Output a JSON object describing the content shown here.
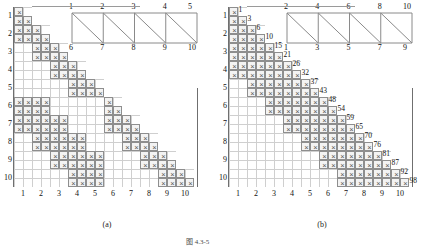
{
  "figure": {
    "caption": "图 4.3-5",
    "subcaptions": [
      "(a)",
      "(b)"
    ]
  },
  "panels": [
    {
      "id": "a",
      "label": "(a)",
      "truss": {
        "name": "truss-diagram-a",
        "top_nodes": [
          "1",
          "2",
          "3",
          "4",
          "5"
        ],
        "bottom_nodes": [
          "6",
          "7",
          "8",
          "9",
          "10"
        ],
        "panels": 4,
        "diagonal_direction": "top-left-to-bottom-right"
      },
      "matrix": {
        "name": "stiffness-matrix-a",
        "type": "banded-lower-triangular",
        "nodes": 10,
        "dof_per_node": 2,
        "row_labels": [
          "1",
          "2",
          "3",
          "4",
          "5",
          "6",
          "7",
          "8",
          "9",
          "10"
        ],
        "col_labels": [
          "1",
          "2",
          "3",
          "4",
          "5",
          "6",
          "7",
          "8",
          "9",
          "10"
        ],
        "connectivity": [
          [
            1
          ],
          [
            1,
            2
          ],
          [
            2,
            3
          ],
          [
            3,
            4
          ],
          [
            4,
            5
          ],
          [
            1,
            2,
            6
          ],
          [
            1,
            2,
            3,
            6,
            7
          ],
          [
            2,
            3,
            4,
            7,
            8
          ],
          [
            3,
            4,
            5,
            8,
            9
          ],
          [
            4,
            5,
            9,
            10
          ]
        ]
      }
    },
    {
      "id": "b",
      "label": "(b)",
      "truss": {
        "name": "truss-diagram-b",
        "top_nodes": [
          "2",
          "4",
          "6",
          "8",
          "10"
        ],
        "bottom_nodes": [
          "1",
          "3",
          "5",
          "7",
          "9"
        ],
        "panels": 4,
        "diagonal_direction": "top-left-to-bottom-right"
      },
      "matrix": {
        "name": "skyline-matrix-b",
        "type": "skyline-lower-triangular",
        "nodes": 10,
        "dof_per_node": 2,
        "row_labels": [
          "1",
          "2",
          "3",
          "4",
          "5",
          "6",
          "7",
          "8",
          "9",
          "10"
        ],
        "col_labels": [
          "1",
          "2",
          "3",
          "4",
          "5",
          "6",
          "7",
          "8",
          "9",
          "10"
        ],
        "diagonal_pointers": [
          1,
          3,
          6,
          10,
          15,
          21,
          26,
          32,
          37,
          43,
          48,
          54,
          59,
          65,
          70,
          76,
          81,
          87,
          92,
          98
        ],
        "connectivity": [
          [
            1
          ],
          [
            1,
            2
          ],
          [
            1,
            2,
            3
          ],
          [
            1,
            2,
            3,
            4
          ],
          [
            2,
            3,
            4,
            5
          ],
          [
            3,
            4,
            5,
            6
          ],
          [
            4,
            5,
            6,
            7
          ],
          [
            5,
            6,
            7,
            8
          ],
          [
            6,
            7,
            8,
            9
          ],
          [
            7,
            8,
            9,
            10
          ]
        ]
      }
    }
  ],
  "colors": {
    "cell_border": "#8e8e8e",
    "cell_fill": "#f3f3f3",
    "grid_line": "#cfcfcf",
    "truss_line": "#8a8a8a",
    "text": "#111111"
  },
  "glyphs": {
    "x_mark": "×"
  }
}
